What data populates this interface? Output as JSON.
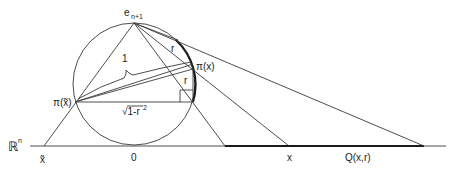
{
  "diagram": {
    "labels": {
      "top_point": "e",
      "top_point_sub": "n+1",
      "pi_x": "π(x)",
      "pi_x_tilde": "π(x̃)",
      "r_upper": "r",
      "r_lower": "r",
      "one": "1",
      "sqrt": "√1-r",
      "sqrt_sup": "2",
      "space": "ℝ",
      "space_sup": "n",
      "x_tilde": "x̃",
      "origin": "0",
      "x": "x",
      "q": "Q(x,r)"
    },
    "colors": {
      "stroke": "#3a3a3a",
      "text": "#222222",
      "background": "#ffffff"
    }
  }
}
